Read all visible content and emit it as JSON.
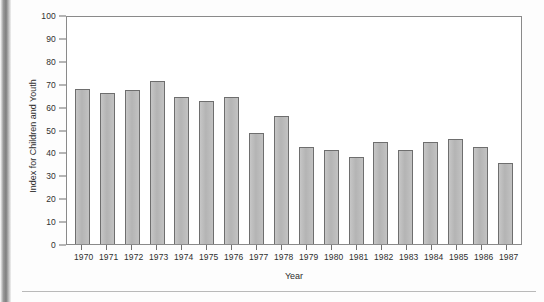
{
  "chart_data": {
    "type": "bar",
    "title": "",
    "xlabel": "Year",
    "ylabel": "Index for Children and Youth",
    "categories": [
      "1970",
      "1971",
      "1972",
      "1973",
      "1974",
      "1975",
      "1976",
      "1977",
      "1978",
      "1979",
      "1980",
      "1981",
      "1982",
      "1983",
      "1984",
      "1985",
      "1986",
      "1987"
    ],
    "values": [
      67.5,
      66,
      67.3,
      71,
      64.3,
      62.5,
      64,
      48.5,
      56,
      42.5,
      41,
      38,
      44.5,
      41,
      44.5,
      46,
      42.5,
      35.5
    ],
    "ylim": [
      0,
      100
    ],
    "ytick_labels": [
      "100",
      "90",
      "80",
      "70",
      "60",
      "50",
      "40",
      "30",
      "20",
      "10",
      "0"
    ],
    "ytick_values": [
      100,
      90,
      80,
      70,
      60,
      50,
      40,
      30,
      20,
      10,
      0
    ],
    "grid": false,
    "legend": null,
    "bar_color": "#bcbcbc",
    "bar_border_color": "#6e6e6e",
    "axis_color": "#8a8a8a"
  }
}
